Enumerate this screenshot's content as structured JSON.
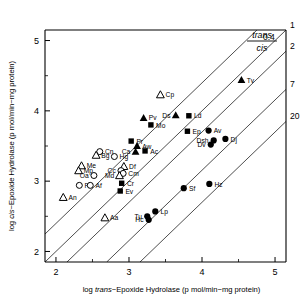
{
  "chart_data": {
    "type": "scatter",
    "title": "",
    "xlabel": "log trans-Epoxide Hydrolase (p mol/min−mg protein)",
    "ylabel": "log cis-Epoxide Hydrolase (p mol/min−mg protein)",
    "xlabel_parts": {
      "pre": "log ",
      "italic": "trans",
      "post": "−Epoxide Hydrolase (p mol/min−mg protein)"
    },
    "ylabel_parts": {
      "pre": "log ",
      "italic": "cis",
      "post": "−Epoxide Hydrolase (p mol/min−mg protein)"
    },
    "xlim": [
      1.85,
      5.15
    ],
    "ylim": [
      1.85,
      5.15
    ],
    "xticks": [
      2,
      3,
      4,
      5
    ],
    "xtick_labels": [
      "2",
      "3",
      "4",
      "5"
    ],
    "yticks": [
      2,
      3,
      4,
      5
    ],
    "ytick_labels": [
      "2",
      "3",
      "4",
      "5"
    ],
    "xminor": [
      2.5,
      3.5,
      4.5
    ],
    "yminor": [
      2.5,
      3.5,
      4.5
    ],
    "grid": false,
    "legend_position": "top-right",
    "legend": {
      "numerator": "trans",
      "denominator": "cis",
      "entries": [
        "1",
        "2",
        "7",
        "20"
      ]
    },
    "ratio_lines": [
      {
        "label": "0.4",
        "ratio": 0.4,
        "intercept": 0.398
      },
      {
        "label": "1",
        "ratio": 1.0,
        "intercept": 0.0
      },
      {
        "label": "2",
        "ratio": 2.0,
        "intercept": -0.301
      },
      {
        "label": "7",
        "ratio": 7.0,
        "intercept": -0.845
      },
      {
        "label": "20",
        "ratio": 20.0,
        "intercept": -1.301
      }
    ],
    "marker_types": {
      "open-circle": "open circle",
      "open-triangle": "open triangle",
      "filled-triangle": "filled triangle",
      "filled-square": "filled square",
      "filled-circle": "filled circle"
    },
    "points": [
      {
        "label": "Cp",
        "x": 3.43,
        "y": 4.23,
        "marker": "open-triangle",
        "anchor": "right"
      },
      {
        "label": "Tv",
        "x": 4.54,
        "y": 4.44,
        "marker": "filled-triangle",
        "anchor": "right"
      },
      {
        "label": "Pv",
        "x": 3.2,
        "y": 3.9,
        "marker": "filled-triangle",
        "anchor": "right"
      },
      {
        "label": "Ds",
        "x": 3.64,
        "y": 3.94,
        "marker": "filled-triangle",
        "anchor": "left"
      },
      {
        "label": "Ld",
        "x": 3.82,
        "y": 3.93,
        "marker": "filled-square",
        "anchor": "right"
      },
      {
        "label": "Mo",
        "x": 3.3,
        "y": 3.8,
        "marker": "filled-square",
        "anchor": "right"
      },
      {
        "label": "Ep",
        "x": 3.8,
        "y": 3.71,
        "marker": "filled-square",
        "anchor": "right"
      },
      {
        "label": "Av",
        "x": 4.09,
        "y": 3.72,
        "marker": "filled-circle",
        "anchor": "right"
      },
      {
        "label": "Dj",
        "x": 4.32,
        "y": 3.6,
        "marker": "filled-circle",
        "anchor": "right"
      },
      {
        "label": "Dsh",
        "x": 4.16,
        "y": 3.58,
        "marker": "filled-circle",
        "anchor": "left"
      },
      {
        "label": "Dv",
        "x": 4.12,
        "y": 3.52,
        "marker": "filled-circle",
        "anchor": "left"
      },
      {
        "label": "Pr",
        "x": 3.03,
        "y": 3.57,
        "marker": "filled-square",
        "anchor": "right"
      },
      {
        "label": "Aw",
        "x": 3.11,
        "y": 3.5,
        "marker": "filled-triangle",
        "anchor": "right"
      },
      {
        "label": "Ac",
        "x": 3.22,
        "y": 3.43,
        "marker": "filled-square",
        "anchor": "right"
      },
      {
        "label": "Ca",
        "x": 3.09,
        "y": 3.42,
        "marker": "filled-triangle",
        "anchor": "left"
      },
      {
        "label": "Cn",
        "x": 2.6,
        "y": 3.42,
        "marker": "open-circle",
        "anchor": "right"
      },
      {
        "label": "Bg",
        "x": 2.55,
        "y": 3.37,
        "marker": "open-triangle",
        "anchor": "right"
      },
      {
        "label": "Hg",
        "x": 2.8,
        "y": 3.35,
        "marker": "open-circle",
        "anchor": "right"
      },
      {
        "label": "Me",
        "x": 2.35,
        "y": 3.22,
        "marker": "open-triangle",
        "anchor": "right"
      },
      {
        "label": "Df",
        "x": 2.93,
        "y": 3.21,
        "marker": "open-triangle",
        "anchor": "right"
      },
      {
        "label": "Mp",
        "x": 2.31,
        "y": 3.15,
        "marker": "open-triangle",
        "anchor": "right"
      },
      {
        "label": "Cc",
        "x": 2.89,
        "y": 3.15,
        "marker": "open-circle",
        "anchor": "left"
      },
      {
        "label": "Cm",
        "x": 2.92,
        "y": 3.11,
        "marker": "open-circle",
        "anchor": "right"
      },
      {
        "label": "Oa",
        "x": 2.52,
        "y": 3.08,
        "marker": "open-circle",
        "anchor": "left"
      },
      {
        "label": "Md",
        "x": 2.87,
        "y": 3.08,
        "marker": "open-triangle",
        "anchor": "left"
      },
      {
        "label": "Hz",
        "x": 4.1,
        "y": 2.96,
        "marker": "filled-circle",
        "anchor": "right"
      },
      {
        "label": "Cr",
        "x": 2.9,
        "y": 2.97,
        "marker": "filled-square",
        "anchor": "right"
      },
      {
        "label": "Pf",
        "x": 2.32,
        "y": 2.94,
        "marker": "open-circle",
        "anchor": "right"
      },
      {
        "label": "Af",
        "x": 2.47,
        "y": 2.94,
        "marker": "open-circle",
        "anchor": "right"
      },
      {
        "label": "Sf",
        "x": 3.75,
        "y": 2.9,
        "marker": "filled-circle",
        "anchor": "right"
      },
      {
        "label": "Ev",
        "x": 2.88,
        "y": 2.86,
        "marker": "filled-square",
        "anchor": "right"
      },
      {
        "label": "An",
        "x": 2.1,
        "y": 2.77,
        "marker": "open-triangle",
        "anchor": "right"
      },
      {
        "label": "Lp",
        "x": 3.36,
        "y": 2.57,
        "marker": "filled-circle",
        "anchor": "right"
      },
      {
        "label": "Aa",
        "x": 2.67,
        "y": 2.48,
        "marker": "open-triangle",
        "anchor": "right"
      },
      {
        "label": "Tu",
        "x": 3.25,
        "y": 2.5,
        "marker": "filled-circle",
        "anchor": "left"
      },
      {
        "label": "Hc",
        "x": 3.27,
        "y": 2.45,
        "marker": "filled-circle",
        "anchor": "left"
      }
    ]
  }
}
